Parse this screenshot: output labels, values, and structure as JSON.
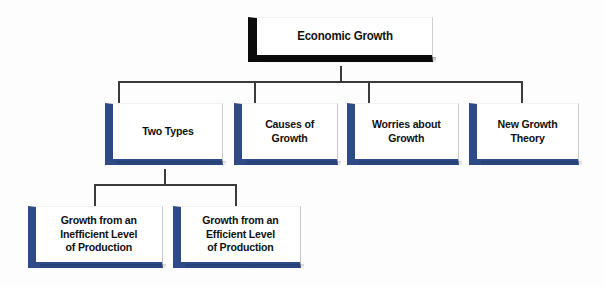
{
  "diagram": {
    "title": "Economic Growth",
    "type": "tree",
    "accent_color": "#2e4a87",
    "root_color": "#0b0b0b",
    "background_color": "#fdfdfd",
    "text_color": "#111111",
    "root": {
      "label": "Economic Growth"
    },
    "level2": [
      {
        "label": "Two Types"
      },
      {
        "label": "Causes of\nGrowth"
      },
      {
        "label": "Worries about\nGrowth"
      },
      {
        "label": "New Growth\nTheory"
      }
    ],
    "level3": [
      {
        "label": "Growth from an\nInefficient Level\nof Production"
      },
      {
        "label": "Growth from an\nEfficient Level\nof Production"
      }
    ]
  }
}
